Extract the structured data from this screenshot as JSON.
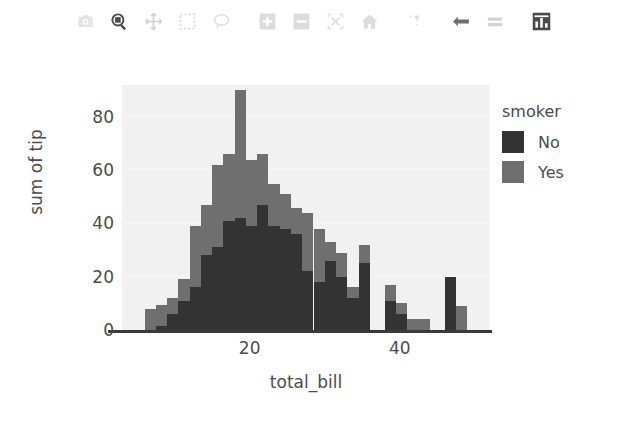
{
  "toolbar": {
    "buttons": [
      {
        "name": "camera-icon",
        "label": "Download plot as a png",
        "active": false
      },
      {
        "name": "zoom-icon",
        "label": "Zoom",
        "active": false
      },
      {
        "name": "pan-icon",
        "label": "Pan",
        "active": false
      },
      {
        "name": "box-select-icon",
        "label": "Box Select",
        "active": false
      },
      {
        "name": "lasso-select-icon",
        "label": "Lasso Select",
        "active": false
      },
      {
        "name": "zoom-in-icon",
        "label": "Zoom in",
        "active": false
      },
      {
        "name": "zoom-out-icon",
        "label": "Zoom out",
        "active": false
      },
      {
        "name": "autoscale-icon",
        "label": "Autoscale",
        "active": false
      },
      {
        "name": "home-icon",
        "label": "Reset axes",
        "active": false
      },
      {
        "name": "spike-lines-icon",
        "label": "Toggle Spike Lines",
        "active": false
      },
      {
        "name": "hover-closest-icon",
        "label": "Show closest data on hover",
        "active": false
      },
      {
        "name": "hover-compare-icon",
        "label": "Compare data on hover",
        "active": false
      },
      {
        "name": "bar-chart-icon",
        "label": "Toggle bar chart",
        "active": true
      }
    ]
  },
  "legend": {
    "title": "smoker",
    "items": [
      {
        "label": "No",
        "color": "#333333"
      },
      {
        "label": "Yes",
        "color": "#6f6f6f"
      }
    ]
  },
  "chart_data": {
    "type": "bar",
    "title": "",
    "xlabel": "total_bill",
    "ylabel": "sum of tip",
    "barmode": "stack",
    "xlim": [
      3,
      52
    ],
    "ylim": [
      0,
      92
    ],
    "xticks": [
      20,
      40
    ],
    "yticks": [
      0,
      20,
      40,
      60,
      80
    ],
    "grid": true,
    "legend_position": "right",
    "legend_title": "smoker",
    "plot_bgcolor": "#f1f1f1",
    "paper_bgcolor": "#ffffff",
    "bin_width": 1.5,
    "x": [
      6.0,
      7.5,
      9.0,
      10.5,
      12.0,
      13.5,
      15.0,
      16.5,
      18.0,
      19.5,
      21.0,
      22.5,
      24.0,
      25.5,
      27.0,
      28.5,
      30.0,
      31.5,
      33.0,
      34.5,
      38.0,
      39.5,
      41.0,
      42.5,
      46.0,
      47.5
    ],
    "series": [
      {
        "name": "No",
        "color": "#333333",
        "values": [
          0,
          1.5,
          6,
          11,
          16,
          28,
          31,
          41,
          42,
          39,
          47,
          39,
          38,
          36,
          22,
          18,
          26,
          20,
          12,
          25,
          11,
          6,
          0,
          0,
          20,
          0
        ]
      },
      {
        "name": "Yes",
        "color": "#6f6f6f",
        "values": [
          8,
          8,
          6,
          8,
          23,
          19,
          31,
          25,
          48,
          25,
          19,
          16,
          13,
          10,
          22,
          20,
          7,
          9,
          4,
          7,
          6,
          4,
          4,
          4,
          0,
          9
        ]
      }
    ]
  }
}
